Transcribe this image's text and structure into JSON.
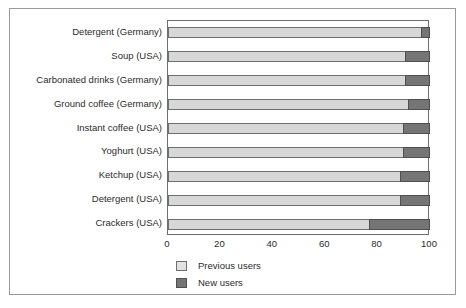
{
  "chart_data": {
    "type": "bar",
    "orientation": "horizontal",
    "stacked": true,
    "title": "",
    "xlabel": "",
    "ylabel": "",
    "xlim": [
      0,
      100
    ],
    "xticks": [
      0,
      20,
      40,
      60,
      80,
      100
    ],
    "grid": false,
    "legend_position": "bottom-left",
    "categories": [
      "Detergent (Germany)",
      "Soup (USA)",
      "Carbonated drinks (Germany)",
      "Ground coffee (Germany)",
      "Instant coffee (USA)",
      "Yoghurt (USA)",
      "Ketchup (USA)",
      "Detergent (USA)",
      "Crackers (USA)"
    ],
    "series": [
      {
        "name": "Previous users",
        "color": "#d7d7d7",
        "values": [
          97,
          91,
          91,
          92,
          90,
          90,
          89,
          89,
          77
        ]
      },
      {
        "name": "New users",
        "color": "#757575",
        "values": [
          3,
          9,
          9,
          8,
          10,
          10,
          11,
          11,
          23
        ]
      }
    ]
  },
  "legend": {
    "items": [
      {
        "label": "Previous users",
        "swatch": "previous-users-swatch"
      },
      {
        "label": "New users",
        "swatch": "new-users-swatch"
      }
    ]
  }
}
